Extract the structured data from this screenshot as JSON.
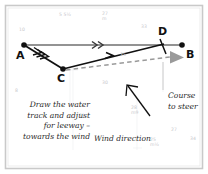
{
  "figure": {
    "background_color": "#ffffff",
    "frame_color": "#bfbfbf"
  },
  "points": [
    {
      "id": "A",
      "label": "A",
      "x": 24,
      "y": 45,
      "label_x": 17,
      "label_y": 50
    },
    {
      "id": "B",
      "label": "B",
      "x": 182,
      "y": 45,
      "label_x": 186,
      "label_y": 50
    },
    {
      "id": "C",
      "label": "C",
      "x": 63,
      "y": 69,
      "label_x": 58,
      "label_y": 73
    },
    {
      "id": "D",
      "label": "D",
      "x": 162,
      "y": 45,
      "label_x": 160,
      "label_y": 28
    }
  ],
  "vectors": {
    "ground_track": {
      "name": "ground-track-A-to-B",
      "style": "solid-gray",
      "chevrons": 2,
      "color": "#6b6b6b"
    },
    "tidal_stream": {
      "name": "tidal-stream-A-to-C",
      "style": "solid-black",
      "chevrons": 3,
      "color": "#111111"
    },
    "water_track": {
      "name": "water-track-C-to-D",
      "style": "solid-black",
      "chevrons": 1,
      "color": "#111111"
    },
    "course_to_steer": {
      "name": "course-to-steer-dashed",
      "style": "dashed-gray",
      "color": "#9a9a9a"
    }
  },
  "annotations": {
    "leeway_note": {
      "name": "leeway-note",
      "lines": [
        "Draw the water",
        "track and adjust",
        "for leeway –",
        "towards the wind"
      ]
    },
    "wind_direction": {
      "name": "wind-direction-label",
      "text": "Wind direction"
    },
    "course_to_steer": {
      "name": "course-to-steer-label",
      "lines": [
        "Course",
        "to steer"
      ]
    }
  },
  "chart_soundings": [
    {
      "value": "5 5½",
      "x": 59,
      "y": 12
    },
    {
      "value": "27",
      "x": 102,
      "y": 11,
      "frac": "m"
    },
    {
      "value": "10",
      "x": 19,
      "y": 27
    },
    {
      "value": "33",
      "x": 141,
      "y": 24
    },
    {
      "value": "8",
      "x": 15,
      "y": 88
    },
    {
      "value": "30",
      "x": 102,
      "y": 80
    },
    {
      "value": "21",
      "x": 79,
      "y": 113
    },
    {
      "value": "28",
      "x": 131,
      "y": 105,
      "frac": "m9"
    },
    {
      "value": "25",
      "x": 150,
      "y": 137,
      "frac": "m½"
    },
    {
      "value": "27",
      "x": 171,
      "y": 127
    },
    {
      "value": "34",
      "x": 190,
      "y": 136
    },
    {
      "value": "35",
      "x": 120,
      "y": 52
    }
  ]
}
